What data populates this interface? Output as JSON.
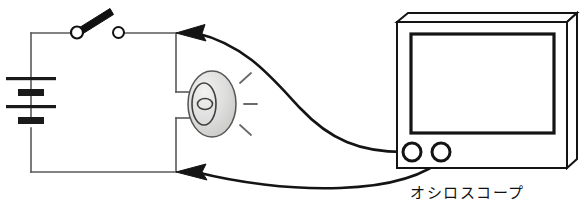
{
  "diagram": {
    "background_color": "#ffffff",
    "line_color": "#1a1a1a",
    "thin_line_color": "#555555",
    "lamp_fill_color": "#d8d8d4",
    "labels": {
      "oscilloscope": "オシロスコープ"
    },
    "components": {
      "battery": {
        "name": "battery",
        "cells": 2,
        "plate_count": 4
      },
      "switch": {
        "name": "knife-switch",
        "state": "open",
        "terminal_count": 2
      },
      "lamp": {
        "name": "lamp",
        "ray_count": 3,
        "filament": "coil"
      },
      "oscilloscope": {
        "name": "oscilloscope",
        "screen": "blank",
        "terminal_count": 2
      }
    },
    "wires": {
      "probe_leads": 2,
      "arrow_count": 2,
      "arrow_direction": "left"
    }
  }
}
